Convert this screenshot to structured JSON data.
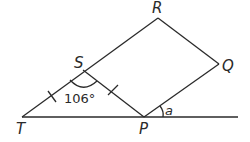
{
  "diagram": {
    "type": "geometry",
    "points": {
      "T": {
        "label": "T",
        "x": 22,
        "y": 117
      },
      "P": {
        "label": "P",
        "x": 144,
        "y": 117
      },
      "S": {
        "label": "S",
        "x": 83,
        "y": 70
      },
      "R": {
        "label": "R",
        "x": 158,
        "y": 18
      },
      "Q": {
        "label": "Q",
        "x": 219,
        "y": 64
      }
    },
    "angle_labels": {
      "TSP": "106°",
      "a": "a"
    },
    "equal_sides": [
      "TS",
      "SP"
    ],
    "line_color": "#2a2a2a"
  }
}
